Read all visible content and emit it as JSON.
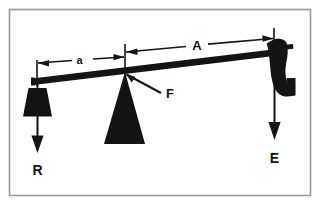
{
  "figure": {
    "border_color": "#9a9a9a",
    "background_color": "#ffffff",
    "ink_color": "#141414"
  },
  "labels": {
    "short_arm": "a",
    "long_arm": "A",
    "fulcrum": "F",
    "resistance": "R",
    "effort": "E"
  },
  "parts": {
    "lever_bar": "lever-bar",
    "fulcrum_triangle": "fulcrum-triangle",
    "weight_block": "weight-block",
    "hand_grip": "hand-grip",
    "resistance_arrow": "resistance-arrow",
    "effort_arrow": "effort-arrow",
    "short_arm_dimension": "short-arm-dimension",
    "long_arm_dimension": "long-arm-dimension",
    "fulcrum_leader": "fulcrum-leader"
  }
}
